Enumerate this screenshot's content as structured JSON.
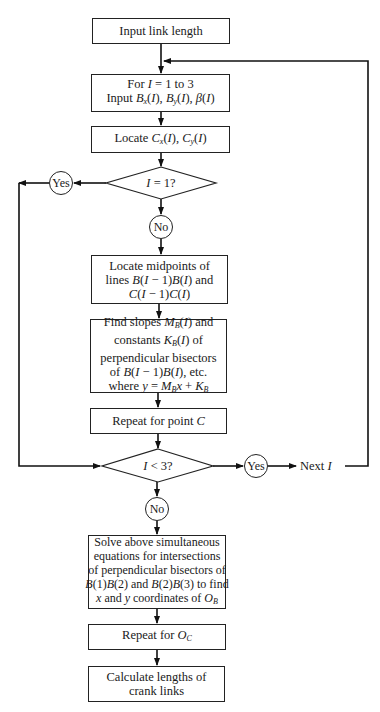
{
  "diagram": {
    "type": "flowchart",
    "nodes": [
      {
        "id": "n1",
        "kind": "process",
        "lines": [
          "Input link length"
        ]
      },
      {
        "id": "n2",
        "kind": "process",
        "lines": [
          "For I = 1 to 3",
          "Input Bx(I), By(I), β(I)"
        ]
      },
      {
        "id": "n3",
        "kind": "process",
        "lines": [
          "Locate Cx(I), Cy(I)"
        ]
      },
      {
        "id": "d1",
        "kind": "decision",
        "text": "I = 1?"
      },
      {
        "id": "c_yes1",
        "kind": "connector",
        "text": "Yes"
      },
      {
        "id": "c_no1",
        "kind": "connector",
        "text": "No"
      },
      {
        "id": "n4",
        "kind": "process",
        "lines": [
          "Locate midpoints of",
          "lines B(I − 1)B(I) and",
          "C(I − 1)C(I)"
        ]
      },
      {
        "id": "n5",
        "kind": "process",
        "lines": [
          "Find slopes MB(I) and",
          "constants KB(I) of",
          "perpendicular bisectors",
          "of B(I − 1)B(I), etc.",
          "where y = MBx + KB"
        ]
      },
      {
        "id": "n6",
        "kind": "process",
        "lines": [
          "Repeat for point C"
        ]
      },
      {
        "id": "d2",
        "kind": "decision",
        "text": "I < 3?"
      },
      {
        "id": "c_yes2",
        "kind": "connector",
        "text": "Yes"
      },
      {
        "id": "next",
        "kind": "label",
        "text": "Next I"
      },
      {
        "id": "c_no2",
        "kind": "connector",
        "text": "No"
      },
      {
        "id": "n7",
        "kind": "process",
        "lines": [
          "Solve above simultaneous",
          "equations for intersections",
          "of perpendicular bisectors of",
          "B(1)B(2) and B(2)B(3) to find",
          "x and y coordinates of OB"
        ]
      },
      {
        "id": "n8",
        "kind": "process",
        "lines": [
          "Repeat for OC"
        ]
      },
      {
        "id": "n9",
        "kind": "process",
        "lines": [
          "Calculate lengths of",
          "crank links"
        ]
      }
    ],
    "edges": [
      {
        "from": "n1",
        "to": "n2"
      },
      {
        "from": "n2",
        "to": "n3"
      },
      {
        "from": "n3",
        "to": "d1"
      },
      {
        "from": "d1",
        "to": "c_yes1",
        "label": "Yes"
      },
      {
        "from": "c_yes1",
        "to": "d2",
        "route": "left loop"
      },
      {
        "from": "d1",
        "to": "c_no1",
        "label": "No"
      },
      {
        "from": "c_no1",
        "to": "n4"
      },
      {
        "from": "n4",
        "to": "n5"
      },
      {
        "from": "n5",
        "to": "n6"
      },
      {
        "from": "n6",
        "to": "d2"
      },
      {
        "from": "d2",
        "to": "c_yes2",
        "label": "Yes"
      },
      {
        "from": "c_yes2",
        "to": "next"
      },
      {
        "from": "next",
        "to": "n2",
        "route": "right loop"
      },
      {
        "from": "d2",
        "to": "c_no2",
        "label": "No"
      },
      {
        "from": "c_no2",
        "to": "n7"
      },
      {
        "from": "n7",
        "to": "n8"
      },
      {
        "from": "n8",
        "to": "n9"
      }
    ]
  }
}
